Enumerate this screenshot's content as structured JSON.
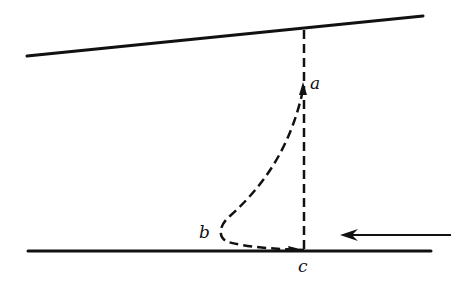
{
  "diagram": {
    "type": "flow-trajectory-between-plates",
    "colors": {
      "ink": "#111111",
      "background": "#ffffff"
    },
    "lines": {
      "upper_boundary": {
        "x1": 27,
        "y1": 56,
        "x2": 423,
        "y2": 16,
        "style": "solid"
      },
      "lower_boundary": {
        "x1": 28,
        "y1": 251,
        "x2": 431,
        "y2": 251,
        "style": "solid"
      },
      "vertical_reference": {
        "x1": 304,
        "y1": 29,
        "x2": 304,
        "y2": 251,
        "style": "dashed"
      }
    },
    "curve": {
      "from": "a",
      "via": "b",
      "to": "c",
      "style": "dashed"
    },
    "labels": {
      "a": "a",
      "b": "b",
      "c": "c"
    },
    "arrow": {
      "direction": "left",
      "x1": 451,
      "y1": 235,
      "x2": 340,
      "y2": 235
    }
  }
}
